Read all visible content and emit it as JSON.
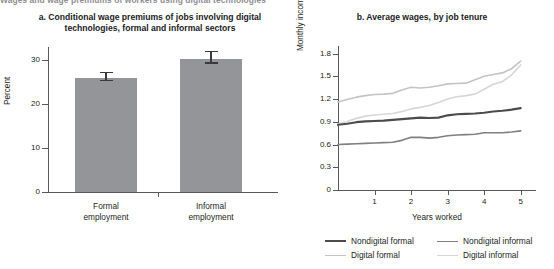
{
  "figure": {
    "clipped_header": "Wages and wage premiums of workers using digital technologies"
  },
  "panel_a": {
    "title": "a. Conditional wage premiums of jobs involving digital technologies, formal and informal sectors"
  },
  "panel_b": {
    "title": "b. Average wages, by job tenure"
  },
  "legend": {
    "items": [
      {
        "label": "Nondigital formal",
        "color": "#4c4c4e",
        "width": "2.2px"
      },
      {
        "label": "Nondigital informal",
        "color": "#808083",
        "width": "1.8px"
      },
      {
        "label": "Digital formal",
        "color": "#c3c4c6",
        "width": "1.8px"
      },
      {
        "label": "Digital informal",
        "color": "#d6d7d9",
        "width": "1.8px"
      }
    ]
  },
  "chart_data": [
    {
      "type": "bar",
      "title": "a. Conditional wage premiums of jobs involving digital technologies, formal and informal sectors",
      "xlabel": "",
      "ylabel": "Percent",
      "categories": [
        "Formal employment",
        "Informal employment"
      ],
      "values": [
        26.0,
        30.2
      ],
      "errors": [
        1.3,
        2.0
      ],
      "ylim": [
        0,
        33
      ],
      "yticks": [
        0,
        10,
        20,
        30
      ],
      "ytick_labels": [
        "0",
        "10",
        "20",
        "30"
      ],
      "bar_color": "#939598",
      "grid": false
    },
    {
      "type": "line",
      "title": "b. Average wages, by job tenure",
      "xlabel": "Years worked",
      "ylabel": "Monthly income (Rp, millions)",
      "x": [
        0,
        0.25,
        0.5,
        0.75,
        1,
        1.25,
        1.5,
        1.75,
        2,
        2.25,
        2.5,
        2.75,
        3,
        3.25,
        3.5,
        3.75,
        4,
        4.25,
        4.5,
        4.75,
        5
      ],
      "xlim": [
        0,
        5.2
      ],
      "xticks": [
        1,
        2,
        3,
        4,
        5
      ],
      "xtick_labels": [
        "1",
        "2",
        "3",
        "4",
        "5"
      ],
      "ylim": [
        0,
        1.9
      ],
      "yticks": [
        0,
        0.3,
        0.6,
        0.9,
        1.2,
        1.5,
        1.8
      ],
      "ytick_labels": [
        "0",
        "0.3",
        "0.6",
        "0.9",
        "1.2",
        "1.5",
        "1.8"
      ],
      "grid": false,
      "legend_position": "bottom",
      "series": [
        {
          "name": "Nondigital formal",
          "color": "#4c4c4e",
          "values": [
            0.86,
            0.875,
            0.895,
            0.905,
            0.91,
            0.915,
            0.925,
            0.935,
            0.945,
            0.955,
            0.95,
            0.955,
            0.985,
            1.0,
            1.005,
            1.01,
            1.02,
            1.035,
            1.045,
            1.06,
            1.08
          ]
        },
        {
          "name": "Nondigital informal",
          "color": "#808083",
          "values": [
            0.6,
            0.605,
            0.61,
            0.615,
            0.62,
            0.625,
            0.63,
            0.655,
            0.695,
            0.695,
            0.685,
            0.695,
            0.715,
            0.725,
            0.73,
            0.735,
            0.755,
            0.755,
            0.755,
            0.765,
            0.78
          ]
        },
        {
          "name": "Digital formal",
          "color": "#c3c4c6",
          "values": [
            1.16,
            1.195,
            1.225,
            1.245,
            1.26,
            1.265,
            1.275,
            1.32,
            1.355,
            1.345,
            1.355,
            1.375,
            1.4,
            1.405,
            1.41,
            1.455,
            1.5,
            1.525,
            1.545,
            1.6,
            1.7
          ]
        },
        {
          "name": "Digital informal",
          "color": "#d6d7d9",
          "values": [
            0.87,
            0.905,
            0.945,
            0.975,
            0.99,
            1.0,
            1.01,
            1.035,
            1.07,
            1.09,
            1.115,
            1.155,
            1.2,
            1.23,
            1.245,
            1.265,
            1.33,
            1.395,
            1.43,
            1.52,
            1.65
          ]
        }
      ]
    }
  ]
}
